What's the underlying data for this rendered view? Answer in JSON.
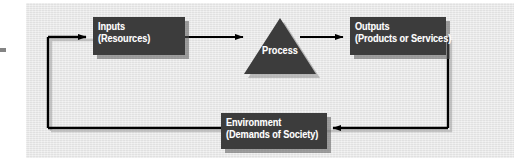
{
  "diagram": {
    "canvas_color": "#e8e8e8",
    "node_color": "#3c3c3c",
    "text_color": "#ffffff",
    "line_color": "#000000",
    "shadow_color": "#5a5a5a",
    "nodes": [
      {
        "id": "inputs",
        "shape": "rectangle",
        "line1": "Inputs",
        "line2": "(Resources)"
      },
      {
        "id": "process",
        "shape": "triangle",
        "label": "Process"
      },
      {
        "id": "outputs",
        "shape": "rectangle",
        "line1": "Outputs",
        "line2": "(Products or Services)"
      },
      {
        "id": "environment",
        "shape": "rectangle",
        "line1": "Environment",
        "line2": "(Demands of Society)"
      }
    ],
    "connectors": [
      {
        "id": "inputs-to-process",
        "from": "inputs",
        "to": "process",
        "direction": "right",
        "arrowhead": true
      },
      {
        "id": "process-to-outputs",
        "from": "process",
        "to": "outputs",
        "direction": "right",
        "arrowhead": true
      },
      {
        "id": "outputs-to-environment",
        "from": "outputs",
        "to": "environment",
        "direction": "left",
        "arrowhead": true
      },
      {
        "id": "environment-to-inputs",
        "from": "environment",
        "to": "inputs",
        "direction": "right",
        "arrowhead": true
      }
    ]
  }
}
